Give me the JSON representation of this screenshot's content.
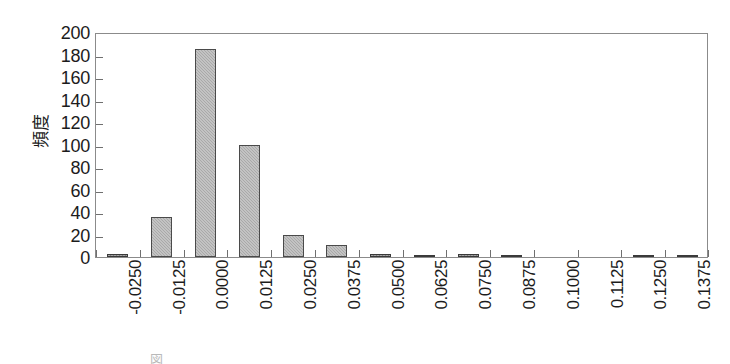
{
  "chart_data": {
    "type": "bar",
    "title": "",
    "subtitle": "",
    "xlabel": "",
    "ylabel": "頻度",
    "categories": [
      "-0.0250",
      "-0.0125",
      "0.0000",
      "0.0125",
      "0.0250",
      "0.0375",
      "0.0500",
      "0.0625",
      "0.0750",
      "0.0875",
      "0.1000",
      "0.1125",
      "0.1250",
      "0.1375"
    ],
    "values": [
      3,
      36,
      185,
      100,
      20,
      11,
      3,
      2,
      3,
      2,
      0,
      0,
      2,
      2
    ],
    "ylim": [
      0,
      200
    ],
    "y_ticks": [
      0,
      20,
      40,
      60,
      80,
      100,
      120,
      140,
      160,
      180,
      200
    ],
    "y_tick_labels": [
      "0",
      "20",
      "40",
      "60",
      "80",
      "100",
      "120",
      "140",
      "160",
      "180",
      "200"
    ],
    "grid": false,
    "legend": false,
    "legend_position": "none",
    "bar_color": "#a9a9a9",
    "bar_edge_color": "#4a4a4a",
    "axis_color": "#8b8b8b",
    "text_color": "#1c1c1c",
    "background_color": "#ffffff",
    "xtick_rotation": 90
  },
  "caption": {
    "text": "図"
  }
}
